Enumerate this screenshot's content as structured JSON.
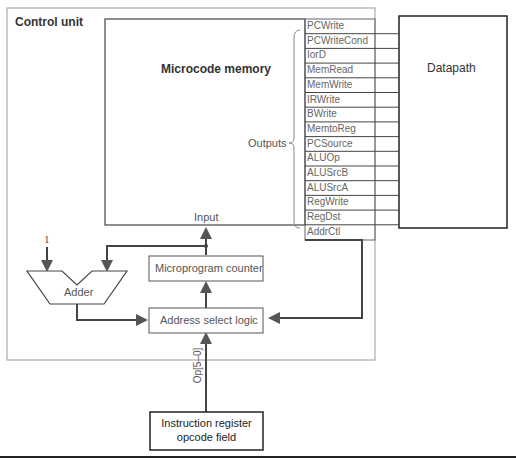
{
  "control_unit": {
    "title": "Control unit"
  },
  "microcode_memory": {
    "title": "Microcode memory",
    "outputs_label": "Outputs",
    "input_label": "Input"
  },
  "signals": [
    "PCWrite",
    "PCWriteCond",
    "IorD",
    "MemRead",
    "MemWrite",
    "IRWrite",
    "BWrite",
    "MemtoReg",
    "PCSource",
    "ALUOp",
    "ALUSrcB",
    "ALUSrcA",
    "RegWrite",
    "RegDst",
    "AddrCtl"
  ],
  "datapath": {
    "title": "Datapath"
  },
  "adder": {
    "title": "Adder",
    "constant": "1"
  },
  "microprogram_counter": {
    "title": "Microprogram counter"
  },
  "address_select_logic": {
    "title": "Address select logic"
  },
  "opcode_bus": {
    "label": "Op[5–0]"
  },
  "instruction_register": {
    "line1": "Instruction register",
    "line2": "opcode field"
  }
}
